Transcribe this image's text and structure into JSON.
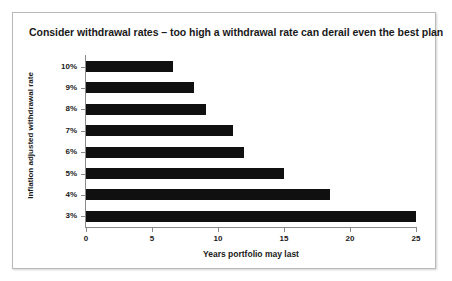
{
  "chart_data": {
    "type": "bar",
    "orientation": "horizontal",
    "title": "Consider withdrawal rates – too high a withdrawal rate can derail even the best plan",
    "xlabel": "Years portfolio may last",
    "ylabel": "Inflation adjusted withdrawal rate",
    "categories": [
      "10%",
      "9%",
      "8%",
      "7%",
      "6%",
      "5%",
      "4%",
      "3%"
    ],
    "values": [
      6.6,
      8.2,
      9.1,
      11.1,
      12,
      15,
      18.5,
      25
    ],
    "xlim": [
      0,
      25
    ],
    "xticks": [
      "0",
      "5",
      "10",
      "15",
      "20",
      "25"
    ],
    "xtick_values": [
      0,
      5,
      10,
      15,
      20,
      25
    ],
    "grid": false,
    "legend": false,
    "bar_color": "#101010",
    "axis_color": "#8a8a8a",
    "background_color": "#ffffff",
    "border_color": "#b9b9b9"
  }
}
